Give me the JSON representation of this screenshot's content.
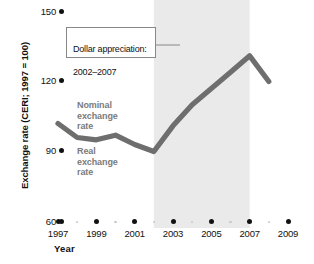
{
  "chart_data": {
    "type": "line",
    "title": "",
    "xlabel": "Year",
    "ylabel": "Exchange rate (CERI; 1997 = 100)",
    "xlim": [
      1996.5,
      2009.5
    ],
    "ylim": [
      60,
      150
    ],
    "grid": false,
    "legend_position": "inline-annotations",
    "x": [
      1997,
      1998,
      1999,
      2000,
      2001,
      2002,
      2003,
      2004,
      2005,
      2006,
      2007,
      2008
    ],
    "series": [
      {
        "name": "Exchange rate (CERI)",
        "color": "#6e6e6e",
        "values": [
          102,
          96,
          95,
          97,
          93,
          90,
          101,
          110,
          117,
          124,
          131,
          120
        ]
      }
    ],
    "y_ticks": [
      60,
      90,
      120,
      150
    ],
    "y_tick_labels": [
      "60",
      "90",
      "120",
      "150"
    ],
    "x_ticks": [
      1997,
      1999,
      2001,
      2003,
      2005,
      2007,
      2009
    ],
    "x_tick_labels": [
      "1997",
      "1999",
      "2001",
      "2003",
      "2005",
      "2007",
      "2009"
    ],
    "x_minor_ticks": [
      1998,
      2000,
      2002,
      2004,
      2006,
      2008
    ],
    "shaded_region": {
      "label": "Dollar appreciation",
      "x_start": 2002,
      "x_end": 2007,
      "color": "#eaeaea"
    },
    "annotations": [
      {
        "name": "dollar-appreciation-callout",
        "text": "Dollar appreciation:\n2002–2007",
        "line1": "Dollar appreciation:",
        "line2": "2002–2007"
      },
      {
        "name": "nominal-exchange-rate-label",
        "text": "Nominal\nexchange\nrate"
      },
      {
        "name": "real-exchange-rate-label",
        "text": "Real\nexchange\nrate"
      }
    ]
  },
  "axis": {
    "y_title": "Exchange rate (CERI; 1997 = 100)",
    "x_title": "Year",
    "y_tick_labels": [
      "150",
      "120",
      "90",
      "60"
    ],
    "x_tick_labels": [
      "1997",
      "1999",
      "2001",
      "2003",
      "2005",
      "2007",
      "2009"
    ]
  },
  "labels": {
    "callout_line1": "Dollar appreciation:",
    "callout_line2": "2002–2007",
    "nominal_l1": "Nominal",
    "nominal_l2": "exchange",
    "nominal_l3": "rate",
    "real_l1": "Real",
    "real_l2": "exchange",
    "real_l3": "rate"
  },
  "colors": {
    "line": "#6e6e6e",
    "shade": "#eaeaea",
    "label_gray": "#7b7b7b",
    "text": "#111111"
  }
}
